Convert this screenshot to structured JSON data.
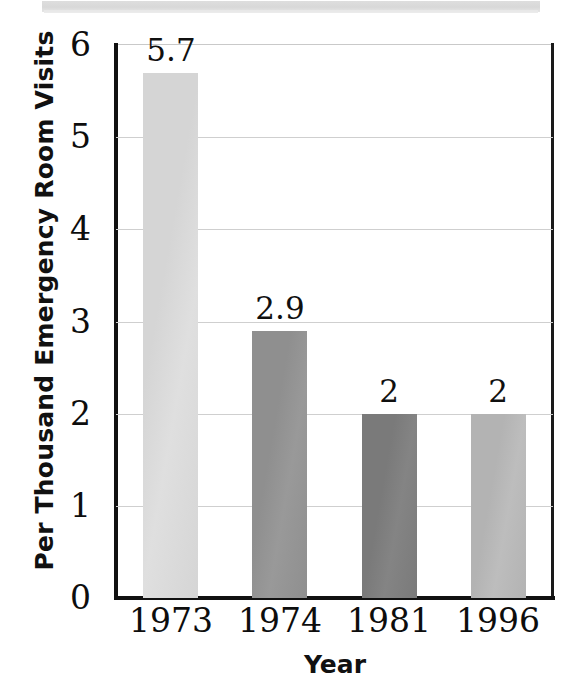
{
  "figure": {
    "background_color": "#ffffff",
    "scan_artifact": {
      "name": "scan-edge-band",
      "color": "#dcdcdc"
    },
    "axis_color": "#111111",
    "gridline_color": "#cfcfcf"
  },
  "chart_data": {
    "type": "bar",
    "title": "",
    "subtitle": "",
    "xlabel": "Year",
    "ylabel": "Per Thousand Emergency Room Visits",
    "categories": [
      "1973",
      "1974",
      "1981",
      "1996"
    ],
    "values": [
      5.7,
      2.9,
      2,
      2
    ],
    "value_labels": [
      "5.7",
      "2.9",
      "2",
      "2"
    ],
    "bar_colors": [
      "#d5d5d5",
      "#8f8f8f",
      "#7a7a7a",
      "#b3b3b3"
    ],
    "ylim": [
      0,
      6
    ],
    "yticks": [
      0,
      1,
      2,
      3,
      4,
      5,
      6
    ],
    "ytick_labels": [
      "0",
      "1",
      "2",
      "3",
      "4",
      "5",
      "6"
    ],
    "grid": true,
    "grid_axis": "y",
    "legend": false,
    "legend_position": "none",
    "annotations": []
  }
}
